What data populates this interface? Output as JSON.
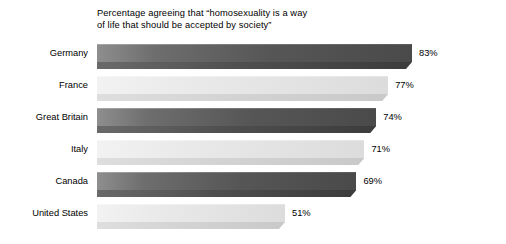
{
  "chart_data": {
    "type": "bar",
    "orientation": "horizontal",
    "title": "Percentage agreeing that “homosexuality is a way\nof life that should be accepted by society”",
    "xlabel": "",
    "ylabel": "",
    "grid": false,
    "legend": "none",
    "xlim": [
      0,
      100
    ],
    "value_suffix": "%",
    "categories": [
      "Germany",
      "France",
      "Great Britain",
      "Italy",
      "Canada",
      "United States"
    ],
    "values": [
      83,
      77,
      74,
      71,
      69,
      51
    ],
    "value_labels": [
      "83%",
      "77%",
      "74%",
      "71%",
      "69%",
      "51%"
    ],
    "bars": [
      {
        "category": "Germany",
        "value": 83,
        "label": "83%",
        "style": "dark"
      },
      {
        "category": "France",
        "value": 77,
        "label": "77%",
        "style": "light"
      },
      {
        "category": "Great Britain",
        "value": 74,
        "label": "74%",
        "style": "dark"
      },
      {
        "category": "Italy",
        "value": 71,
        "label": "71%",
        "style": "light"
      },
      {
        "category": "Canada",
        "value": 69,
        "label": "69%",
        "style": "dark"
      },
      {
        "category": "United States",
        "value": 51,
        "label": "51%",
        "style": "light"
      }
    ],
    "colors": {
      "background": "#ffffff",
      "text": "#000000",
      "bar_dark": "#565656",
      "bar_dark_bevel": "#4f4f4f",
      "bar_light": "#e2e2e2",
      "bar_light_bevel": "#d2d2d2"
    }
  }
}
